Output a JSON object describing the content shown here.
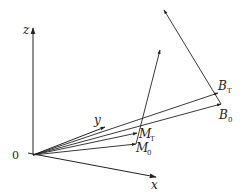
{
  "diagram": {
    "title": "",
    "origin_label": "0",
    "axes": {
      "z": "z",
      "y": "y",
      "x": "x"
    },
    "points": {
      "B_T": {
        "main": "B",
        "sub": "T"
      },
      "B_0": {
        "main": "B",
        "sub": "0"
      },
      "M_T": {
        "main": "M",
        "sub": "T"
      },
      "M_0": {
        "main": "M",
        "sub": "0"
      }
    },
    "colors": {
      "line": "#222222",
      "background": "#ffffff"
    }
  }
}
